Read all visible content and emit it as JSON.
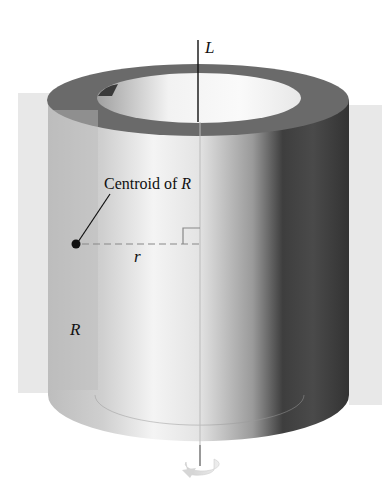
{
  "figure": {
    "labels": {
      "axis": "L",
      "centroid_prefix": "Centroid of ",
      "centroid_var": "R",
      "radius": "r",
      "region": "R"
    },
    "colors": {
      "background": "#ffffff",
      "plane": "#e6e6e6",
      "top_ring": "#6e6e6e",
      "inner_hole_light": "#f4f4f4",
      "cylinder_light": "#f2f2f2",
      "cylinder_dark": "#3a3a3a",
      "region": "#c8c8c8",
      "line": "#111111",
      "dashed": "#888888"
    }
  }
}
